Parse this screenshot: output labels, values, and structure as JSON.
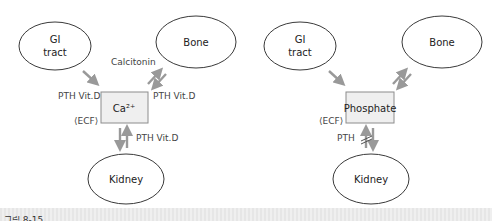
{
  "diagrams": [
    {
      "name": "calcium",
      "nodes": {
        "gi": {
          "line1": "GI",
          "line2": "tract"
        },
        "bone": {
          "label": "Bone"
        },
        "center": {
          "label": "Ca²⁺"
        },
        "kidney": {
          "label": "Kidney"
        }
      },
      "labels": {
        "gi_to_center": "PTH Vit.D",
        "center_to_bone": "Calcitonin",
        "bone_to_center": "PTH Vit.D",
        "ecf": "⟨ECF⟩",
        "kidney_to_center": "PTH Vit.D"
      }
    },
    {
      "name": "phosphate",
      "nodes": {
        "gi": {
          "line1": "GI",
          "line2": "tract"
        },
        "bone": {
          "label": "Bone"
        },
        "center": {
          "label": "Phosphate"
        },
        "kidney": {
          "label": "Kidney"
        }
      },
      "labels": {
        "ecf": "⟨ECF⟩",
        "kidney_to_center": "PTH"
      }
    }
  ],
  "caption": "그림 8-15",
  "colors": {
    "arrow": "#999999",
    "box_fill": "#efefef",
    "ellipse_stroke": "#3a3a3a"
  }
}
